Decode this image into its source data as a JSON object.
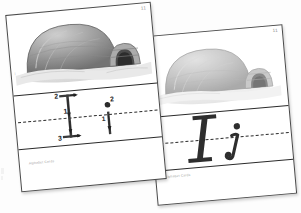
{
  "scene": {
    "background_color": "#fdfdfd",
    "description": "Two overlapping handwriting practice flashcards photographed at a slight angle"
  },
  "cards": [
    {
      "id": "stroke-order-card",
      "page_number": "11",
      "corner_mark": "i",
      "illustration": {
        "name": "igloo-illustration",
        "subject": "igloo",
        "style": "grayscale pencil drawing",
        "dome_color": "#8d8d8d",
        "tunnel_color": "#3a3a3a",
        "snow_color": "#e4e4e4"
      },
      "writing_band": {
        "midline_style": "dashed",
        "line_color": "#2b2b2b",
        "letters": [
          {
            "glyph": "I",
            "case": "uppercase",
            "stroke_labels": [
              "2",
              "1",
              "3"
            ]
          },
          {
            "glyph": "i",
            "case": "lowercase",
            "stroke_labels": [
              "1",
              "2"
            ]
          }
        ]
      },
      "caption": "Alphabet Cards"
    },
    {
      "id": "model-letter-card",
      "page_number": "11",
      "corner_mark": "i",
      "illustration": {
        "name": "igloo-illustration",
        "subject": "igloo",
        "style": "grayscale pencil drawing, faded",
        "dome_color": "#a4a4a4",
        "tunnel_color": "#4a4a4a",
        "snow_color": "#ececec"
      },
      "writing_band": {
        "midline_style": "dashed",
        "line_color": "#2b2b2b",
        "letters": [
          {
            "glyph": "I",
            "case": "uppercase",
            "stroke_labels": []
          },
          {
            "glyph": "i",
            "case": "lowercase",
            "stroke_labels": []
          }
        ]
      },
      "caption": "Alphabet Cards"
    }
  ]
}
